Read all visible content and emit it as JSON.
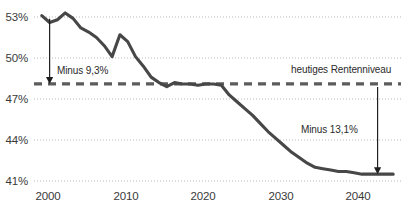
{
  "chart_data": {
    "type": "line",
    "title": "",
    "xlabel": "",
    "ylabel": "",
    "xlim": [
      1999,
      2046
    ],
    "ylim": [
      41,
      53.9
    ],
    "grid": true,
    "gridlines_y": [
      41,
      44,
      47,
      50,
      53
    ],
    "ytick_labels": [
      "41%",
      "44%",
      "47%",
      "50%",
      "53%"
    ],
    "ytick_values": [
      41,
      44,
      47,
      50,
      53
    ],
    "xtick_labels": [
      "2000",
      "2010",
      "2020",
      "2030",
      "2040"
    ],
    "xtick_values": [
      2000,
      2010,
      2020,
      2030,
      2040
    ],
    "legend": "none",
    "series": [
      {
        "name": "Rentenniveau",
        "color": "#474747",
        "x": [
          2000,
          2001,
          2002,
          2003,
          2004,
          2005,
          2006,
          2007,
          2008,
          2009,
          2010,
          2011,
          2012,
          2013,
          2014,
          2015,
          2016,
          2017,
          2018,
          2019,
          2020,
          2021,
          2022,
          2023,
          2024,
          2025,
          2026,
          2027,
          2028,
          2029,
          2030,
          2031,
          2032,
          2033,
          2034,
          2035,
          2036,
          2037,
          2038,
          2039,
          2040,
          2041,
          2042,
          2043,
          2044,
          2045
        ],
        "values": [
          53.1,
          52.6,
          52.8,
          53.3,
          52.9,
          52.2,
          51.9,
          51.5,
          50.9,
          50.1,
          51.7,
          51.2,
          50.1,
          49.4,
          48.6,
          48.2,
          47.9,
          48.2,
          48.1,
          48.1,
          48.0,
          48.1,
          48.1,
          48.0,
          47.3,
          46.8,
          46.3,
          45.8,
          45.2,
          44.6,
          44.1,
          43.6,
          43.1,
          42.7,
          42.3,
          42.0,
          41.9,
          41.8,
          41.7,
          41.7,
          41.6,
          41.5,
          41.5,
          41.5,
          41.5,
          41.5
        ]
      }
    ],
    "reference_line": {
      "label": "heutiges Rentenniveau",
      "value": 48.1,
      "style": "dashed",
      "color": "#5c5c5c"
    },
    "annotations": [
      {
        "text": "Minus 9,3%",
        "arrow": "down",
        "from_year": 2001,
        "from_value": 53.1,
        "to_value": 48.1
      },
      {
        "text": "Minus 13,1%",
        "arrow": "down",
        "from_year": 2043,
        "from_value": 48.1,
        "to_value": 41.5
      }
    ]
  },
  "labels": {
    "reference_line_label": "heutiges Rentenniveau",
    "annotation_left": "Minus 9,3%",
    "annotation_right": "Minus 13,1%",
    "y_53": "53%",
    "y_50": "50%",
    "y_47": "47%",
    "y_44": "44%",
    "y_41": "41%",
    "x_2000": "2000",
    "x_2010": "2010",
    "x_2020": "2020",
    "x_2030": "2030",
    "x_2040": "2040"
  },
  "colors": {
    "line": "#474747",
    "grid": "#b9b9b9",
    "reference": "#5c5c5c",
    "text": "#3a3a3a",
    "background": "#ffffff"
  }
}
